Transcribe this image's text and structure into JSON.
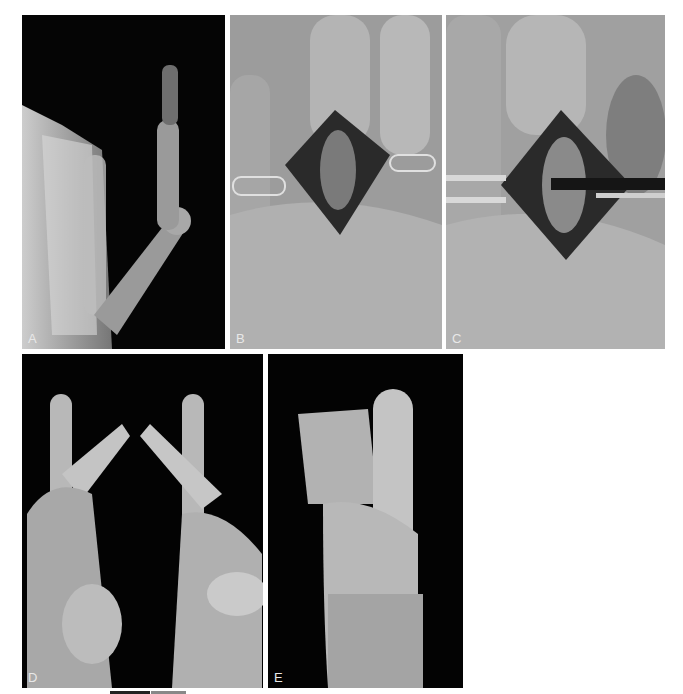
{
  "figure": {
    "panels": [
      {
        "id": "A",
        "label": "A",
        "description": "Radiograph of hand showing flexed finger joint"
      },
      {
        "id": "B",
        "label": "B",
        "description": "Surgical exposure over dorsal finger joint with retractor"
      },
      {
        "id": "C",
        "label": "C",
        "description": "Surgical exposure with instrument inserted into joint"
      },
      {
        "id": "D",
        "label": "D",
        "description": "Two hands with fingers touching tips, lateral view"
      },
      {
        "id": "E",
        "label": "E",
        "description": "Hand forming a fist, lateral view"
      }
    ],
    "colors": {
      "background": "#ffffff",
      "panel_dark": "#050505",
      "panel_gray": "#8a8a8a",
      "label": "#e8e8e8"
    }
  }
}
